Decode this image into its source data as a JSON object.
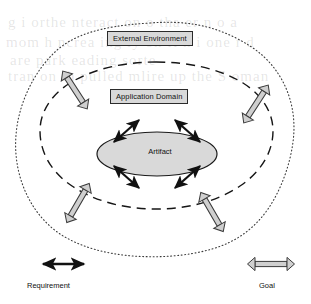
{
  "figure": {
    "type": "nested-context-diagram",
    "background_color": "#ffffff"
  },
  "regions": [
    {
      "id": "external-environment",
      "label": "External Environment",
      "boundary_style": "dotted",
      "boundary_color": "#3a3a3a",
      "fill": "none",
      "level": 1
    },
    {
      "id": "application-domain",
      "label": "Application Domain",
      "boundary_style": "dashed",
      "boundary_color": "#1a1a1a",
      "fill": "none",
      "level": 2
    },
    {
      "id": "artifact",
      "label": "Artifact",
      "boundary_style": "solid",
      "boundary_color": "#1a1a1a",
      "fill": "#d9d9d9",
      "level": 3
    }
  ],
  "label_boxes": {
    "external_environment": "External Environment",
    "application_domain": "Application Domain",
    "artifact": "Artifact",
    "box_fill": "#d9d9d9",
    "box_border": "#2b2b2b"
  },
  "connectors": {
    "requirement": {
      "name": "Requirement",
      "style": "solid-filled",
      "color": "#111111",
      "heads": "double",
      "count": 4,
      "description": "solid black double-headed arrows radiating diagonally from the Artifact ellipse into the Application Domain"
    },
    "goal": {
      "name": "Goal",
      "style": "hollow-outline",
      "fill": "#cfcfcf",
      "stroke": "#3a3a3a",
      "heads": "double",
      "count": 4,
      "description": "hollow double-headed arrows crossing the Application Domain dashed boundary into the External Environment"
    }
  },
  "legend": {
    "items": [
      {
        "id": "requirement",
        "label": "Requirement",
        "arrow": "solid-double-arrow",
        "color": "#111111"
      },
      {
        "id": "goal",
        "label": "Goal",
        "arrow": "hollow-double-arrow",
        "fill": "#cfcfcf",
        "stroke": "#3a3a3a"
      }
    ]
  },
  "background_bleed": {
    "visible": true,
    "note": "faint reverse-side scanned text showing through the page",
    "lines": [
      "g   i   orthe nteract on o  tha  er   n    o   a",
      "mom   h   ncrea ing  ly  on  fi  h  i  one  r  d",
      "are park  eading       sorte",
      "tran    on    th  pulled  mlire  up   the  S     oman"
    ]
  }
}
